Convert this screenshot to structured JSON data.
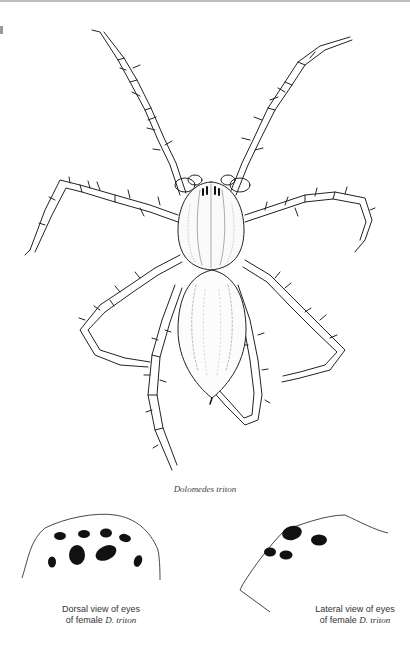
{
  "figure": {
    "species_caption": "Dolomedes triton"
  },
  "insets": [
    {
      "name": "dorsal",
      "caption_line1": "Dorsal view of eyes",
      "caption_line2_prefix": "of female ",
      "caption_line2_species": "D. triton"
    },
    {
      "name": "lateral",
      "caption_line1": "Lateral view of eyes",
      "caption_line2_prefix": "of female ",
      "caption_line2_species": "D. triton"
    }
  ],
  "colors": {
    "ink": "#222222",
    "paper": "#ffffff",
    "caption": "#444444"
  }
}
